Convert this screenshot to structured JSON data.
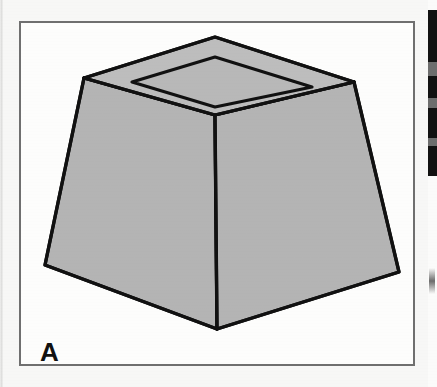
{
  "figure": {
    "label": "A",
    "caption_letter": "A",
    "object_name": "truncated-square-pyramid-with-recessed-top",
    "colors": {
      "face_fill": "#b4b4b4",
      "top_rim_fill": "#bdbdbd",
      "inner_top_fill": "#b8b8b8",
      "outline": "#111111",
      "panel_background": "#fdfdfc",
      "panel_border": "#6f6f6f",
      "page_background": "#f7f7f6",
      "label_color": "#111111"
    },
    "geometry": {
      "outer_top_back": [
        194,
        14
      ],
      "outer_top_left": [
        63,
        55
      ],
      "outer_top_right": [
        333,
        59
      ],
      "outer_top_front": [
        194,
        92
      ],
      "inner_top_back": [
        194,
        34
      ],
      "inner_top_left": [
        111,
        59
      ],
      "inner_top_right": [
        291,
        64
      ],
      "inner_top_front": [
        194,
        84
      ],
      "base_left": [
        24,
        242
      ],
      "base_front": [
        196,
        306
      ],
      "base_right": [
        378,
        249
      ]
    }
  },
  "neighbor_strip": {
    "name": "adjacent-figure-edge",
    "blocks": [
      {
        "top": 10,
        "height": 52
      },
      {
        "top": 76,
        "height": 22
      },
      {
        "top": 108,
        "height": 30
      },
      {
        "top": 146,
        "height": 30
      }
    ],
    "grays": [
      {
        "top": 62,
        "height": 14
      },
      {
        "top": 98,
        "height": 10
      },
      {
        "top": 138,
        "height": 8
      }
    ],
    "smudges": [
      {
        "top": 268,
        "left": 1
      }
    ]
  }
}
